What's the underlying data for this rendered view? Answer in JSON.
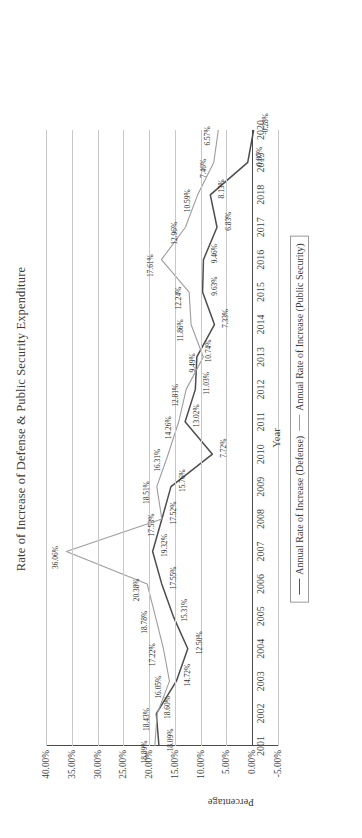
{
  "chart_data": {
    "type": "line",
    "title": "Rate of Increase of Defense & Public Security Expenditure",
    "xlabel": "Year",
    "ylabel": "Percentage",
    "grid": true,
    "legend_position": "bottom",
    "ylim": [
      -5,
      40
    ],
    "yticks": [
      "-5.00%",
      "0.00%",
      "5.00%",
      "10.00%",
      "15.00%",
      "20.00%",
      "25.00%",
      "30.00%",
      "35.00%",
      "40.00%"
    ],
    "ytick_values": [
      -5,
      0,
      5,
      10,
      15,
      20,
      25,
      30,
      35,
      40
    ],
    "categories": [
      "2001",
      "2002",
      "2003",
      "2004",
      "2005",
      "2006",
      "2007",
      "2008",
      "2009",
      "2010",
      "2011",
      "2012",
      "2013",
      "2014",
      "2015",
      "2016",
      "2017",
      "2018",
      "2019",
      "2020"
    ],
    "series": [
      {
        "name": "Annual Rate of Increase (Defense)",
        "color": "#4d4d4d",
        "values": [
          18.09,
          18.6,
          14.72,
          12.5,
          15.31,
          17.55,
          19.32,
          17.52,
          15.76,
          7.72,
          13.02,
          11.03,
          10.74,
          7.33,
          9.63,
          9.46,
          6.83,
          8.13,
          0.87,
          -0.28
        ],
        "labels": [
          "18.09%",
          "18.60%",
          "14.72%",
          "12.50%",
          "15.31%",
          "17.55%",
          "19.32%",
          "17.52%",
          "15.76%",
          "7.72%",
          "13.02%",
          "11.03%",
          "10.74%",
          "7.33%",
          "9.63%",
          "9.46%",
          "6.83%",
          "8.13%",
          "0.87%",
          "-0.28%"
        ]
      },
      {
        "name": "Annual Rate of Increase (Public Security)",
        "color": "#9d9d9d",
        "values": [
          18.89,
          18.43,
          16.05,
          17.22,
          18.78,
          20.38,
          36.06,
          17.53,
          18.51,
          16.31,
          14.26,
          12.81,
          9.49,
          11.86,
          12.24,
          17.61,
          12.96,
          10.59,
          7.46,
          6.57
        ],
        "labels": [
          "18.89%",
          "18.43%",
          "16.05%",
          "17.22%",
          "18.78%",
          "20.38%",
          "36.06%",
          "17.53%",
          "18.51%",
          "16.31%",
          "14.26%",
          "12.81%",
          "9.49%",
          "11.86%",
          "12.24%",
          "17.61%",
          "12.96%",
          "10.59%",
          "7.46%",
          "6.57%"
        ]
      }
    ]
  },
  "legend": {
    "entries": [
      "Annual Rate of Increase (Defense)",
      "Annual Rate of Increase (Public Security)"
    ]
  }
}
